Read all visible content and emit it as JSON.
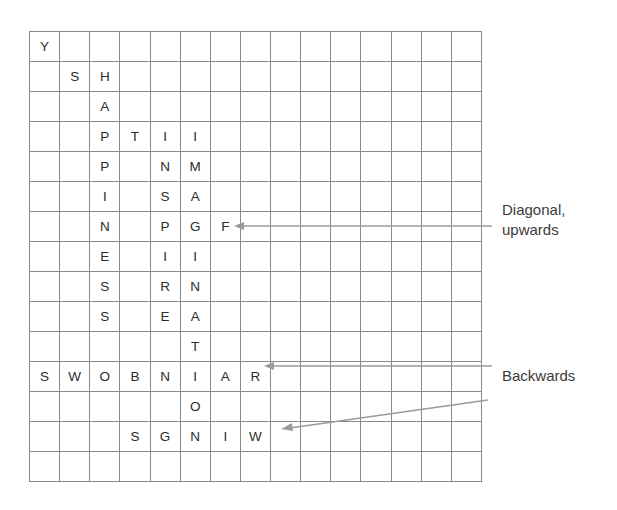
{
  "puzzle": {
    "type": "word-search",
    "rows": 15,
    "cols": 15,
    "cell_px": 30,
    "grid_line_color": "#8a8a8a",
    "letter_color": "#2b2b2b",
    "letters": [
      [
        "Y",
        "",
        "",
        "",
        "",
        "",
        "",
        "",
        "",
        "",
        "",
        "",
        "",
        "",
        ""
      ],
      [
        "",
        "S",
        "H",
        "",
        "",
        "",
        "",
        "",
        "",
        "",
        "",
        "",
        "",
        "",
        ""
      ],
      [
        "",
        "",
        "A",
        "",
        "",
        "",
        "",
        "",
        "",
        "",
        "",
        "",
        "",
        "",
        ""
      ],
      [
        "",
        "",
        "P",
        "T",
        "I",
        "I",
        "",
        "",
        "",
        "",
        "",
        "",
        "",
        "",
        ""
      ],
      [
        "",
        "",
        "P",
        "",
        "N",
        "M",
        "",
        "",
        "",
        "",
        "",
        "",
        "",
        "",
        ""
      ],
      [
        "",
        "",
        "I",
        "",
        "S",
        "A",
        "",
        "",
        "",
        "",
        "",
        "",
        "",
        "",
        ""
      ],
      [
        "",
        "",
        "N",
        "",
        "P",
        "G",
        "F",
        "",
        "",
        "",
        "",
        "",
        "",
        "",
        ""
      ],
      [
        "",
        "",
        "E",
        "",
        "I",
        "I",
        "",
        "",
        "",
        "",
        "",
        "",
        "",
        "",
        ""
      ],
      [
        "",
        "",
        "S",
        "",
        "R",
        "N",
        "",
        "",
        "",
        "",
        "",
        "",
        "",
        "",
        ""
      ],
      [
        "",
        "",
        "S",
        "",
        "E",
        "A",
        "",
        "",
        "",
        "",
        "",
        "",
        "",
        "",
        ""
      ],
      [
        "",
        "",
        "",
        "",
        "",
        "T",
        "",
        "",
        "",
        "",
        "",
        "",
        "",
        "",
        ""
      ],
      [
        "S",
        "W",
        "O",
        "B",
        "N",
        "I",
        "A",
        "R",
        "",
        "",
        "",
        "",
        "",
        "",
        ""
      ],
      [
        "",
        "",
        "",
        "",
        "",
        "O",
        "",
        "",
        "",
        "",
        "",
        "",
        "",
        "",
        ""
      ],
      [
        "",
        "",
        "",
        "S",
        "G",
        "N",
        "I",
        "W",
        "",
        "",
        "",
        "",
        "",
        "",
        ""
      ],
      [
        "",
        "",
        "",
        "",
        "",
        "",
        "",
        "",
        "",
        "",
        "",
        "",
        "",
        "",
        ""
      ]
    ]
  },
  "annotations": {
    "diagonal": {
      "line1": "Diagonal,",
      "line2": "upwards",
      "arrow_color": "#9a9a9a"
    },
    "backwards": {
      "label": "Backwards",
      "arrow_color": "#9a9a9a"
    }
  }
}
